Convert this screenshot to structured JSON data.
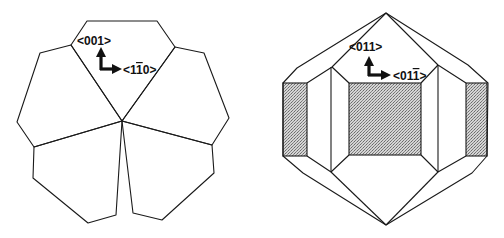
{
  "figure": {
    "left_crystal": {
      "description": "Five-lobed cross-section view (pentagonal twin)",
      "axis_labels": {
        "vertical": "<001>",
        "horizontal": "<1̄ 10>"
      },
      "vertical_label_parts": [
        "<001>"
      ],
      "horizontal_label_parts": {
        "pre": "<1",
        "barred": "1",
        "post": "0>"
      }
    },
    "right_crystal": {
      "description": "Decahedral crystal side view with shaded {100} facets",
      "axis_labels": {
        "vertical": "<011>",
        "horizontal": "<011̄>"
      },
      "vertical_label_parts": [
        "<011>"
      ],
      "horizontal_label_parts": {
        "pre": "<01",
        "barred": "1",
        "post": ">"
      }
    },
    "colors": {
      "line": "#1a1a1a",
      "shade": "#b8b8b8",
      "background": "#ffffff"
    }
  }
}
